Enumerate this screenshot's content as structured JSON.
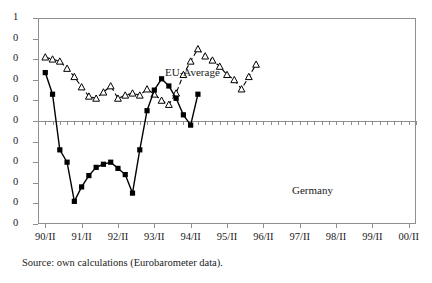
{
  "figure": {
    "caption": "Source: own calculations (Eurobarometer data)."
  },
  "labels": {
    "eu_average": "EU-Average",
    "germany": "Germany"
  },
  "chart_data": {
    "type": "line",
    "title": "",
    "xlabel": "",
    "ylabel": "",
    "grid": false,
    "legend_position": "inline-annotation",
    "ylim": [
      -1.0,
      1.0
    ],
    "ytick_labels": [
      "1",
      "0",
      "0",
      "0",
      "0",
      "0",
      "0",
      "0",
      "0",
      "0",
      "0"
    ],
    "ytick_values": [
      1.0,
      0.8,
      0.6,
      0.4,
      0.2,
      0.0,
      -0.2,
      -0.4,
      -0.6,
      -0.8,
      -1.0
    ],
    "ytick_note": "y-axis tick labels are clipped at the left image edge; only the leading digit is rendered",
    "xtick_labels": [
      "90/II",
      "91/II",
      "92/II",
      "93/II",
      "94/II",
      "95/II",
      "96/II",
      "97/II",
      "98/II",
      "99/II",
      "00/II"
    ],
    "x_minor_ticks_between_labels": 4,
    "series": [
      {
        "name": "EU-Average",
        "style": "dashed",
        "marker": "open-triangle",
        "color": "#000000",
        "values": [
          0.62,
          0.6,
          0.58,
          0.51,
          0.43,
          0.33,
          0.24,
          0.22,
          0.28,
          0.34,
          0.22,
          0.25,
          0.27,
          0.25,
          0.31,
          0.26,
          0.2,
          0.16,
          0.27,
          0.45,
          0.58,
          0.7,
          0.63,
          0.59,
          0.53,
          0.45,
          0.4,
          0.31,
          0.43,
          0.55
        ]
      },
      {
        "name": "Germany",
        "style": "solid",
        "marker": "filled-square",
        "color": "#000000",
        "values": [
          0.47,
          0.26,
          -0.28,
          -0.4,
          -0.78,
          -0.64,
          -0.53,
          -0.45,
          -0.42,
          -0.4,
          -0.46,
          -0.52,
          -0.7,
          -0.28,
          0.1,
          0.3,
          0.41,
          0.34,
          0.22,
          0.06,
          -0.04,
          0.26
        ]
      }
    ]
  }
}
